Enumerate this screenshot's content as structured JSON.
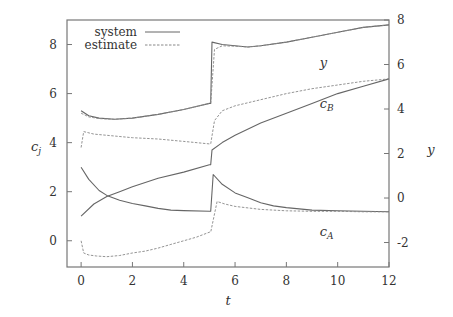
{
  "chart_data": {
    "type": "line",
    "title": "",
    "xlabel": "t",
    "ylabel_left": "c_j",
    "ylabel_right": "y",
    "xlim": [
      -0.55,
      12
    ],
    "ylim_left": [
      -1.07,
      9.0
    ],
    "ylim_right": [
      -3.1,
      8.0
    ],
    "xticks": [
      0,
      2,
      4,
      6,
      8,
      10,
      12
    ],
    "yticks_left": [
      0,
      2,
      4,
      6,
      8
    ],
    "yticks_right": [
      -2,
      0,
      2,
      4,
      6,
      8
    ],
    "grid": false,
    "legend": {
      "position": "top-left",
      "entries": [
        {
          "label": "system",
          "style": "solid"
        },
        {
          "label": "estimate",
          "style": "dashed"
        }
      ]
    },
    "annotations": [
      {
        "text": "y",
        "sub": "",
        "t": 9.3,
        "v": 7.1
      },
      {
        "text": "c",
        "sub": "B",
        "t": 9.3,
        "v": 5.4
      },
      {
        "text": "c",
        "sub": "A",
        "t": 9.3,
        "v": 0.2
      }
    ],
    "series": [
      {
        "name": "y (system)",
        "style": "solid",
        "x": [
          0,
          0.3,
          0.7,
          1.3,
          2,
          3,
          4,
          5,
          5.05,
          5.1,
          5.5,
          6,
          6.5,
          7,
          8,
          9,
          10,
          11,
          12
        ],
        "values": [
          5.3,
          5.1,
          5.0,
          4.95,
          5.0,
          5.15,
          5.35,
          5.6,
          5.6,
          8.1,
          8.0,
          7.95,
          7.9,
          7.95,
          8.1,
          8.3,
          8.5,
          8.7,
          8.8
        ]
      },
      {
        "name": "y (estimate)",
        "style": "dashed",
        "x": [
          0,
          0.3,
          0.7,
          1.3,
          2,
          3,
          4,
          5,
          5.05,
          5.2,
          5.5,
          6,
          6.5,
          7,
          8,
          9,
          10,
          11,
          12
        ],
        "values": [
          5.2,
          5.05,
          4.98,
          4.95,
          5.0,
          5.15,
          5.35,
          5.6,
          5.6,
          7.8,
          7.95,
          7.93,
          7.9,
          7.95,
          8.1,
          8.3,
          8.5,
          8.7,
          8.8
        ]
      },
      {
        "name": "c_B (system)",
        "style": "solid",
        "x": [
          0,
          0.5,
          1,
          1.5,
          2,
          3,
          4,
          5,
          5.05,
          5.1,
          5.5,
          6,
          7,
          8,
          9,
          10,
          11,
          12
        ],
        "values": [
          1.0,
          1.5,
          1.8,
          2.0,
          2.2,
          2.55,
          2.8,
          3.1,
          3.1,
          3.7,
          4.0,
          4.3,
          4.8,
          5.2,
          5.6,
          6.0,
          6.3,
          6.6
        ]
      },
      {
        "name": "c_B (estimate)",
        "style": "dashed",
        "x": [
          0,
          0.1,
          0.5,
          1,
          2,
          3,
          4,
          5,
          5.05,
          5.2,
          5.5,
          6,
          7,
          8,
          9,
          10,
          11,
          12
        ],
        "values": [
          3.8,
          4.45,
          4.35,
          4.3,
          4.2,
          4.15,
          4.05,
          3.95,
          3.95,
          4.9,
          5.3,
          5.5,
          5.75,
          6.0,
          6.2,
          6.35,
          6.5,
          6.6
        ]
      },
      {
        "name": "c_A (system)",
        "style": "solid",
        "x": [
          0,
          0.3,
          0.7,
          1,
          1.5,
          2,
          2.5,
          3,
          3.5,
          4,
          5,
          5.05,
          5.15,
          5.5,
          6,
          6.5,
          7,
          7.5,
          8,
          9,
          10,
          11,
          12
        ],
        "values": [
          3.0,
          2.5,
          2.05,
          1.85,
          1.65,
          1.52,
          1.42,
          1.32,
          1.25,
          1.23,
          1.2,
          1.2,
          2.7,
          2.3,
          1.95,
          1.75,
          1.55,
          1.42,
          1.35,
          1.25,
          1.22,
          1.2,
          1.18
        ]
      },
      {
        "name": "c_A (estimate)",
        "style": "dashed",
        "x": [
          0,
          0.1,
          0.3,
          0.6,
          1,
          1.5,
          2,
          2.5,
          3,
          3.5,
          4,
          4.5,
          5,
          5.05,
          5.3,
          5.6,
          6,
          7,
          8,
          9,
          10,
          11,
          12
        ],
        "values": [
          0.0,
          -0.5,
          -0.58,
          -0.62,
          -0.65,
          -0.6,
          -0.5,
          -0.42,
          -0.3,
          -0.15,
          0.0,
          0.15,
          0.35,
          0.35,
          1.6,
          1.5,
          1.4,
          1.28,
          1.22,
          1.2,
          1.2,
          1.18,
          1.18
        ]
      }
    ]
  }
}
